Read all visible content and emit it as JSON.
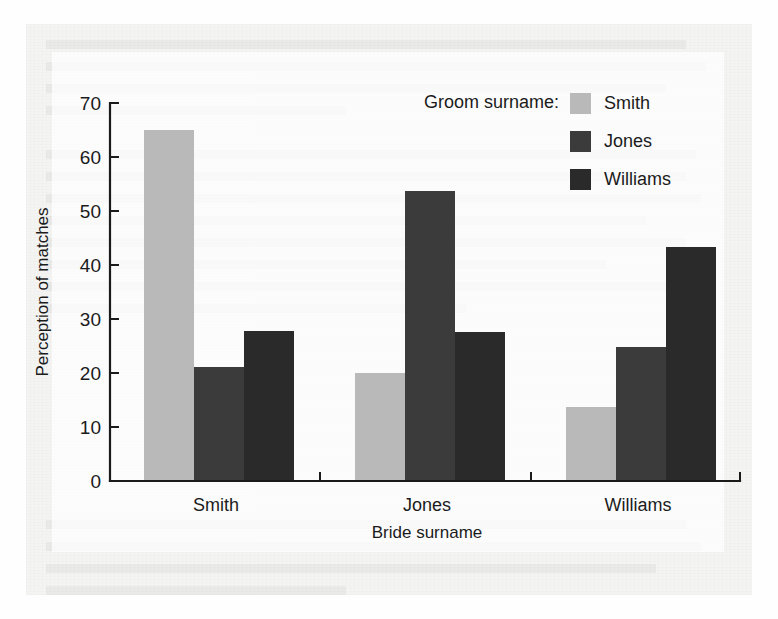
{
  "chart_data": {
    "type": "bar",
    "title": "",
    "xlabel": "Bride surname",
    "ylabel": "Perception of matches",
    "categories": [
      "Smith",
      "Jones",
      "Williams"
    ],
    "series": [
      {
        "name": "Smith",
        "color": "#b9b9b9",
        "values": [
          65.0,
          20.0,
          13.8
        ]
      },
      {
        "name": "Jones",
        "color": "#3b3b3b",
        "values": [
          21.1,
          53.8,
          24.9
        ]
      },
      {
        "name": "Williams",
        "color": "#2a2a2a",
        "values": [
          27.8,
          27.6,
          43.4
        ]
      }
    ],
    "ylim": [
      0,
      70
    ],
    "yticks": [
      0,
      10,
      20,
      30,
      40,
      50,
      60,
      70
    ],
    "ytick_labels": [
      "0",
      "10",
      "20",
      "30",
      "40",
      "50",
      "60",
      "70"
    ],
    "grid": false,
    "legend": {
      "title": "Groom surname:",
      "position": "top-right",
      "entries": [
        {
          "label": "Smith",
          "color": "#b9b9b9"
        },
        {
          "label": "Jones",
          "color": "#3b3b3b"
        },
        {
          "label": "Williams",
          "color": "#2a2a2a"
        }
      ]
    }
  },
  "figure": {
    "background_color": "#f4f4f3",
    "axis_color": "#1a1a1a"
  }
}
